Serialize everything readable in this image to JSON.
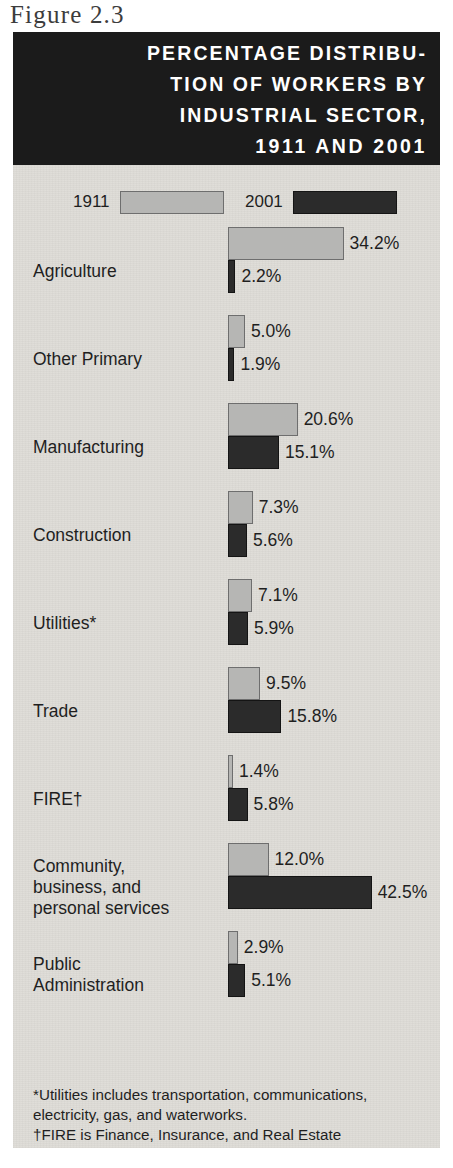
{
  "figure_label": "Figure 2.3",
  "title": {
    "lines": [
      "PERCENTAGE DISTRIBU-",
      "TION OF WORKERS BY",
      "INDUSTRIAL SECTOR,",
      "1911 AND 2001"
    ]
  },
  "legend": {
    "items": [
      {
        "label": "1911",
        "swatch": "#b6b6b4"
      },
      {
        "label": "2001",
        "swatch": "#2b2b2b"
      }
    ]
  },
  "footnotes": [
    "*Utilities includes transportation, communications,\n electricity, gas, and waterworks.",
    "†FIRE is Finance, Insurance, and Real Estate"
  ],
  "colors": {
    "panel_background": "#dedcd7",
    "banner_background": "#1b1b1b",
    "series_1911": "#b6b6b4",
    "series_2001": "#2b2b2b",
    "text": "#1f1f1f"
  },
  "chart_data": {
    "type": "bar",
    "orientation": "horizontal",
    "xlabel": "",
    "ylabel": "",
    "grid": false,
    "legend_position": "top",
    "xlim": [
      0,
      45
    ],
    "units": "percent",
    "categories": [
      "Agriculture",
      "Other Primary",
      "Manufacturing",
      "Construction",
      "Utilities*",
      "Trade",
      "FIRE†",
      "Community,\nbusiness, and\npersonal services",
      "Public\nAdministration"
    ],
    "series": [
      {
        "name": "1911",
        "color": "#b6b6b4",
        "values": [
          34.2,
          5.0,
          20.6,
          7.3,
          7.1,
          9.5,
          1.4,
          12.0,
          2.9
        ],
        "labels": [
          "34.2%",
          "5.0%",
          "20.6%",
          "7.3%",
          "7.1%",
          "9.5%",
          "1.4%",
          "12.0%",
          "2.9%"
        ]
      },
      {
        "name": "2001",
        "color": "#2b2b2b",
        "values": [
          2.2,
          1.9,
          15.1,
          5.6,
          5.9,
          15.8,
          5.8,
          42.5,
          5.1
        ],
        "labels": [
          "2.2%",
          "1.9%",
          "15.1%",
          "5.6%",
          "5.9%",
          "15.8%",
          "5.8%",
          "42.5%",
          "5.1%"
        ]
      }
    ]
  },
  "layout": {
    "px_per_percent": 3.38,
    "bar_height": 33,
    "row_gap": 22
  }
}
